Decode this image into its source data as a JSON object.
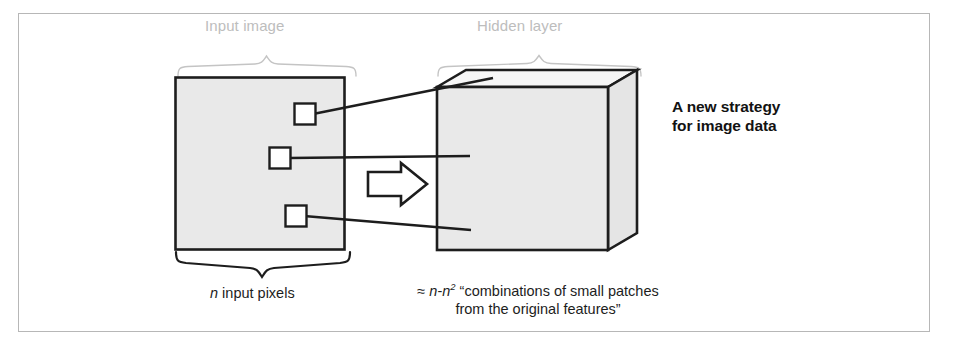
{
  "figure": {
    "border_color": "#b7b7b7",
    "background": "#ffffff"
  },
  "labels": {
    "input_image": "Input image",
    "hidden_layer": "Hidden layer",
    "label_color": "#bdbdbd"
  },
  "headline": {
    "line1": "A new strategy",
    "line2": "for image data",
    "color": "#121212"
  },
  "captions": {
    "input_pixels": {
      "italic_symbol": "n",
      "rest": " input pixels"
    },
    "hidden_layer": {
      "approx": "≈ ",
      "italic_n1": "n",
      "dash": "-",
      "italic_n2": "n",
      "exponent": "2",
      "quote_open": " “combinations of small",
      "line2": "patches from the original features”"
    }
  },
  "diagram": {
    "input_square": {
      "name": "input-image-square",
      "fill": "#e9e9e9",
      "stroke": "#1d1d1d",
      "x": 175,
      "y": 77,
      "width": 170,
      "height": 173
    },
    "patches": [
      {
        "name": "patch-top",
        "x": 294,
        "y": 103,
        "size": 21
      },
      {
        "name": "patch-middle",
        "x": 269,
        "y": 148,
        "size": 21
      },
      {
        "name": "patch-bottom",
        "x": 285,
        "y": 205,
        "size": 21
      }
    ],
    "hidden_box": {
      "name": "hidden-layer-cube",
      "front_fill": "#e9e9e9",
      "side_fill": "#e4e4e4",
      "top_fill": "#f4f4f4",
      "stroke": "#1d1d1d",
      "front_x": 437,
      "front_y": 87,
      "front_w": 171,
      "front_h": 163,
      "depth_dx": 29,
      "depth_dy": -17
    },
    "arrow": {
      "name": "transform-arrow",
      "fill": "#ffffff",
      "stroke": "#1d1d1d",
      "direction": "right"
    },
    "connectors": [
      {
        "name": "connector-top",
        "from_x": 315,
        "from_y": 113,
        "to_x": 470,
        "to_y": 79
      },
      {
        "name": "connector-middle",
        "from_x": 290,
        "from_y": 158,
        "to_x": 470,
        "to_y": 156
      },
      {
        "name": "connector-bottom",
        "from_x": 306,
        "from_y": 215,
        "to_x": 470,
        "to_y": 230
      }
    ],
    "braces": {
      "stroke_light": "#bdbdbd",
      "stroke_dark": "#1d1d1d",
      "input_top": {
        "name": "brace-input-top",
        "x1": 178,
        "x2": 356,
        "y": 66
      },
      "hidden_top": {
        "name": "brace-hidden-top",
        "x1": 437,
        "x2": 641,
        "y": 66
      },
      "input_bottom": {
        "name": "brace-input-bottom",
        "x1": 176,
        "x2": 350,
        "y": 258
      }
    }
  }
}
